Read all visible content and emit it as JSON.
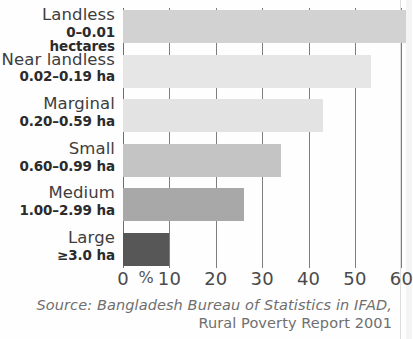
{
  "chart_data": {
    "type": "bar",
    "orientation": "horizontal",
    "title": "",
    "xlabel": "%",
    "ylabel": "",
    "xlim": [
      0,
      63
    ],
    "grid": true,
    "legend": null,
    "categories": [
      "Landless",
      "Near landless",
      "Marginal",
      "Small",
      "Medium",
      "Large"
    ],
    "category_ranges": [
      "0–0.01 hectares",
      "0.02–0.19 ha",
      "0.20–0.59 ha",
      "0.60–0.99 ha",
      "1.00–2.99 ha",
      "≥3.0 ha"
    ],
    "values": [
      61,
      53.5,
      43,
      34,
      26,
      10
    ],
    "bar_colors": [
      "#d2d2d2",
      "#e6e6e6",
      "#e3e3e3",
      "#c4c4c4",
      "#a8a8a8",
      "#575757"
    ],
    "xticks": [
      0,
      10,
      20,
      30,
      40,
      50,
      60
    ],
    "xtick_labels": [
      "0",
      "10",
      "20",
      "30",
      "40",
      "50",
      "60"
    ],
    "percent_symbol": "%"
  },
  "source": {
    "line1": "Source: Bangladesh Bureau of Statistics in IFAD,",
    "line2": "Rural Poverty Report 2001"
  },
  "colors": {
    "gridline": "#7d7d7d",
    "background": "#fefefe",
    "label_text": "#3d3d3d",
    "range_text": "#2b2b2b",
    "tick_text": "#4a4a4a",
    "source_text": "#6f6f6f"
  }
}
